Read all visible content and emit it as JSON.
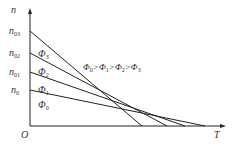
{
  "axes": {
    "y_label": "n",
    "x_label": "T",
    "origin_label": "O"
  },
  "y_ticks": [
    {
      "base": "n",
      "sub": "03"
    },
    {
      "base": "n",
      "sub": "02"
    },
    {
      "base": "n",
      "sub": "01"
    },
    {
      "base": "n",
      "sub": "0"
    }
  ],
  "region_labels": [
    {
      "base": "Φ",
      "sub": "3"
    },
    {
      "base": "Φ",
      "sub": "2"
    },
    {
      "base": "Φ",
      "sub": "1"
    },
    {
      "base": "Φ",
      "sub": "0"
    }
  ],
  "relation": {
    "parts": [
      {
        "base": "Φ",
        "sub": "0"
      },
      {
        "op": ">"
      },
      {
        "base": "Φ",
        "sub": "1"
      },
      {
        "op": ">"
      },
      {
        "base": "Φ",
        "sub": "2"
      },
      {
        "op": ">"
      },
      {
        "base": "Φ",
        "sub": "3"
      }
    ],
    "text": "Φ0>Φ1>Φ2>Φ3"
  },
  "colors": {
    "line": "#222222",
    "text": "#333333"
  }
}
